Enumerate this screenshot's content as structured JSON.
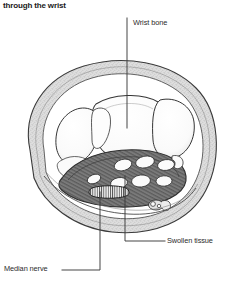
{
  "caption": {
    "text": "through the wrist"
  },
  "figure": {
    "name": "wrist-cross-section-carpal-tunnel",
    "style": "grayscale-stippled-medical-illustration",
    "colors": {
      "ink": "#2b2b2b",
      "soft_tissue_fill": "#d9d9d9",
      "soft_tissue_stipple": "#8d8d8d",
      "bone_fill": "#fefefe",
      "bone_outline": "#3a3a3a",
      "tunnel_dark": "#6e6e6e",
      "tunnel_darker": "#4f4f4f",
      "tendon_fill": "#fbfbfb",
      "leader_line": "#3c3c3c",
      "background": "#ffffff"
    }
  },
  "labels": [
    {
      "id": "wrist-bone",
      "text": "Wrist bone",
      "leader": "vertical line down to carpal bone"
    },
    {
      "id": "swollen-tissue",
      "text": "Swollen tissue",
      "leader": "vertical line up then horizontal right"
    },
    {
      "id": "median-nerve",
      "text": "Median nerve",
      "leader": "horizontal right then vertical up to flattened nerve"
    }
  ]
}
